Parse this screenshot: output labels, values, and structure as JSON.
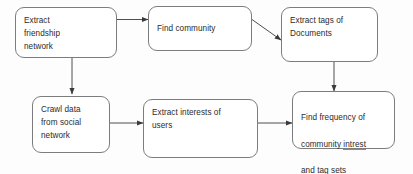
{
  "diagram": {
    "background_color": "#fdfdfd",
    "node_border_color": "#7d7d7d",
    "node_fill_color": "#ffffff",
    "text_color": "#2b2b2b",
    "edge_color": "#3a3a3a",
    "nodes": [
      {
        "id": "extract-friendship-network",
        "label": "Extract\nfriendship\nnetwork",
        "lines": [
          "Extract",
          "friendship",
          "network"
        ]
      },
      {
        "id": "find-community",
        "label": "Find community",
        "lines": [
          "Find community"
        ]
      },
      {
        "id": "extract-tags-of-documents",
        "label": "Extract tags of\nDocuments",
        "lines": [
          "Extract tags of",
          "Documents"
        ]
      },
      {
        "id": "crawl-data-from-social-network",
        "label": "Crawl data\nfrom social\nnetwork",
        "lines": [
          "Crawl data",
          "from social",
          "network"
        ]
      },
      {
        "id": "extract-interests-of-users",
        "label": "Extract interests of\nusers",
        "lines": [
          "Extract interests of",
          "users"
        ]
      },
      {
        "id": "find-frequency",
        "label_line1": "Find frequency of",
        "label_line2_prefix": "community ",
        "label_line2_misspelled": "intrest",
        "label_line3": "and tag sets",
        "label": "Find frequency of\ncommunity intrest\nand tag sets",
        "misspelled_word": "intrest"
      }
    ],
    "edges": [
      {
        "id": "edge-friendship-to-community",
        "from": "extract-friendship-network",
        "to": "find-community",
        "style": "horizontal-arrow"
      },
      {
        "id": "edge-community-to-tags",
        "from": "find-community",
        "to": "extract-tags-of-documents",
        "style": "diagonal-arrow"
      },
      {
        "id": "edge-friendship-to-crawl",
        "from": "extract-friendship-network",
        "to": "crawl-data-from-social-network",
        "style": "vertical-arrow"
      },
      {
        "id": "edge-tags-to-frequency",
        "from": "extract-tags-of-documents",
        "to": "find-frequency",
        "style": "vertical-arrow"
      },
      {
        "id": "edge-crawl-to-interests",
        "from": "crawl-data-from-social-network",
        "to": "extract-interests-of-users",
        "style": "horizontal-arrow"
      },
      {
        "id": "edge-interests-to-frequency",
        "from": "extract-interests-of-users",
        "to": "find-frequency",
        "style": "horizontal-arrow"
      }
    ]
  }
}
